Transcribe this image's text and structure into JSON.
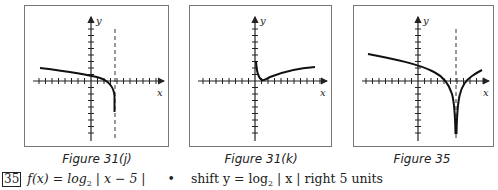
{
  "figures": [
    {
      "id": "fig-31j",
      "caption": "Figure 31(j)",
      "x_label": "x",
      "y_label": "y",
      "asymptote": "dashed vertical line right of y-axis",
      "curve": "decreasing curve approaching asymptote from left, falling steeply downward"
    },
    {
      "id": "fig-31k",
      "caption": "Figure 31(k)",
      "x_label": "x",
      "y_label": "y",
      "asymptote": "y-axis",
      "curve": "curve dropping from y-axis to near origin then rising slowly to right"
    },
    {
      "id": "fig-35",
      "caption": "Figure 35",
      "x_label": "x",
      "y_label": "y",
      "asymptote": "dashed vertical line at x = 5",
      "curve": "two branches falling toward asymptote at x = 5, symmetric"
    }
  ],
  "problem": {
    "number": "35",
    "function_lhs": "f(x) = log",
    "base": "2",
    "function_arg": " | x − 5 |",
    "bullet": "•",
    "description_pre": "shift y = log",
    "description_base": "2",
    "description_post": " | x |  right 5 units"
  }
}
